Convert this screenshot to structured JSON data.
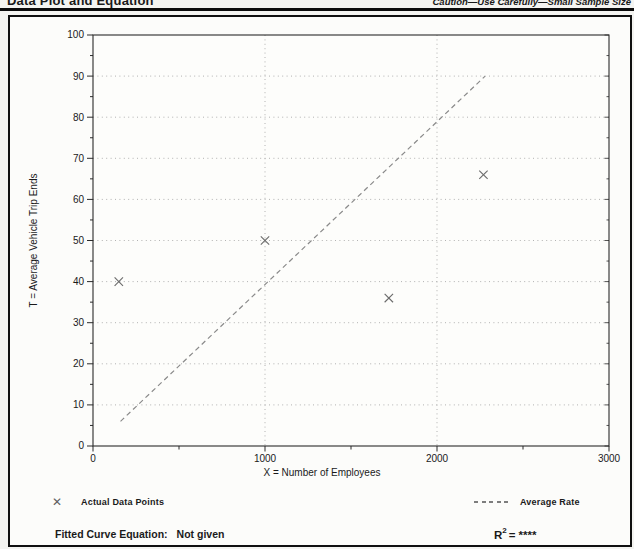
{
  "header": {
    "title": "Data Plot and Equation",
    "caution": "Caution—Use Carefully—Small Sample Size"
  },
  "legend": {
    "actual_points_label": "Actual Data Points",
    "average_rate_label": "Average Rate"
  },
  "footer": {
    "equation_label": "Fitted Curve Equation:",
    "equation_value": "Not given",
    "r_symbol": "R",
    "r_exponent": "2",
    "r_equals": "=",
    "r_value": "****"
  },
  "icons": {
    "data_point_marker": "✕"
  },
  "colors": {
    "frame": "#101010",
    "axis": "#2a2a2a",
    "grid": "#a9a9a9",
    "trend": "#8a8a8a",
    "marker": "#6a6a6a",
    "text": "#1a1a1a",
    "plot_bg": "#fdfdfb"
  },
  "chart_data": {
    "type": "scatter",
    "title": "",
    "xlabel": "X = Number of Employees",
    "ylabel": "T = Average Vehicle Trip Ends",
    "xlim": [
      0,
      3000
    ],
    "ylim": [
      0,
      100
    ],
    "x_major_ticks": [
      0,
      1000,
      2000,
      3000
    ],
    "x_minor_ticks": [
      500,
      1500,
      2500
    ],
    "y_major_step": 10,
    "y_minor_step": 5,
    "grid_horizontal": [
      10,
      20,
      30,
      40,
      50,
      60,
      70,
      80,
      90
    ],
    "grid_vertical": [
      1000,
      2000
    ],
    "grid_style": "dotted",
    "legend_position": "below",
    "series": [
      {
        "name": "Actual Data Points",
        "type": "scatter",
        "marker": "x",
        "points": [
          [
            150,
            40
          ],
          [
            1000,
            50
          ],
          [
            1720,
            36
          ],
          [
            2270,
            66
          ]
        ]
      },
      {
        "name": "Average Rate",
        "type": "line",
        "style": "dashed",
        "points": [
          [
            160,
            6
          ],
          [
            2280,
            90
          ]
        ]
      }
    ]
  }
}
